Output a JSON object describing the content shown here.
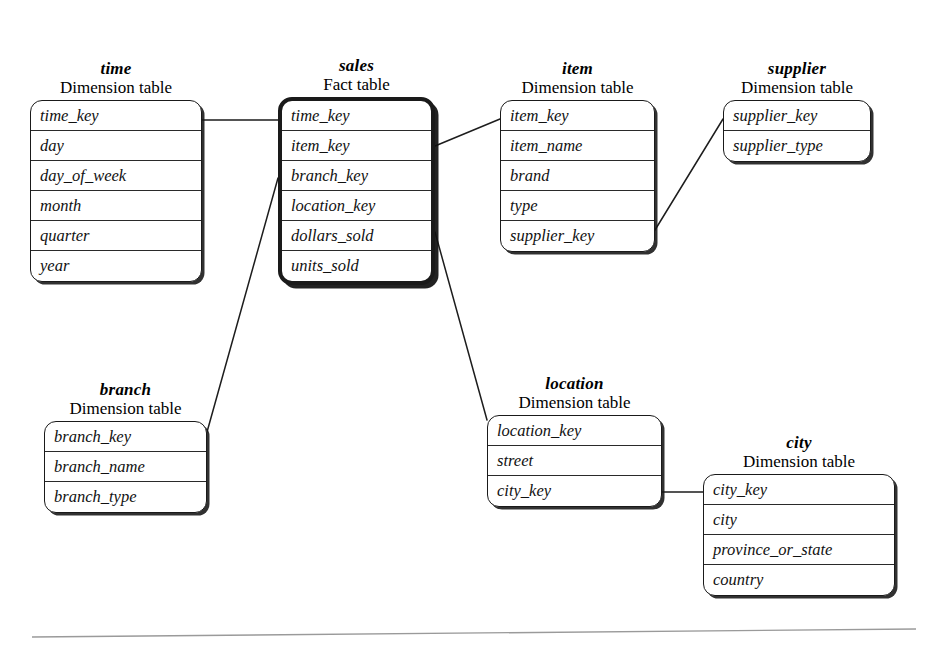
{
  "figure": {
    "kind": "snowflake-schema-diagram",
    "subtitle_dimension": "Dimension table",
    "subtitle_fact": "Fact table"
  },
  "entities": [
    {
      "id": "time",
      "name": "time",
      "subtitle": "Dimension table",
      "role": "dimension",
      "x": 30,
      "y": 103,
      "width": 172,
      "fields": [
        "time_key",
        "day",
        "day_of_week",
        "month",
        "quarter",
        "year"
      ]
    },
    {
      "id": "sales",
      "name": "sales",
      "subtitle": "Fact table",
      "role": "fact",
      "x": 278,
      "y": 100,
      "width": 157,
      "fields": [
        "time_key",
        "item_key",
        "branch_key",
        "location_key",
        "dollars_sold",
        "units_sold"
      ]
    },
    {
      "id": "item",
      "name": "item",
      "subtitle": "Dimension table",
      "role": "dimension",
      "x": 500,
      "y": 103,
      "width": 155,
      "fields": [
        "item_key",
        "item_name",
        "brand",
        "type",
        "supplier_key"
      ]
    },
    {
      "id": "supplier",
      "name": "supplier",
      "subtitle": "Dimension table",
      "role": "dimension",
      "x": 723,
      "y": 103,
      "width": 148,
      "fields": [
        "supplier_key",
        "supplier_type"
      ]
    },
    {
      "id": "branch",
      "name": "branch",
      "subtitle": "Dimension table",
      "role": "dimension",
      "x": 44,
      "y": 424,
      "width": 163,
      "fields": [
        "branch_key",
        "branch_name",
        "branch_type"
      ]
    },
    {
      "id": "location",
      "name": "location",
      "subtitle": "Dimension table",
      "role": "dimension",
      "x": 487,
      "y": 418,
      "width": 175,
      "fields": [
        "location_key",
        "street",
        "city_key"
      ]
    },
    {
      "id": "city",
      "name": "city",
      "subtitle": "Dimension table",
      "role": "dimension",
      "x": 703,
      "y": 477,
      "width": 192,
      "fields": [
        "city_key",
        "city",
        "province_or_state",
        "country"
      ]
    }
  ],
  "connectors": [
    {
      "id": "time-sales",
      "from": "time",
      "to": "sales",
      "points": "202,120 278,120"
    },
    {
      "id": "sales-item",
      "from": "sales",
      "to": "item",
      "points": "435,146 500,119"
    },
    {
      "id": "item-supplier",
      "from": "item",
      "to": "supplier",
      "points": "655,230 723,119"
    },
    {
      "id": "sales-branch",
      "from": "sales",
      "to": "branch",
      "points": "278,178 207,432"
    },
    {
      "id": "sales-location",
      "from": "sales",
      "to": "location",
      "points": "435,232 487,420"
    },
    {
      "id": "location-city",
      "from": "location",
      "to": "city",
      "points": "662,492 703,492"
    }
  ],
  "page_rule": {
    "x1": 32,
    "y1": 637,
    "x2": 916,
    "y2": 629
  }
}
